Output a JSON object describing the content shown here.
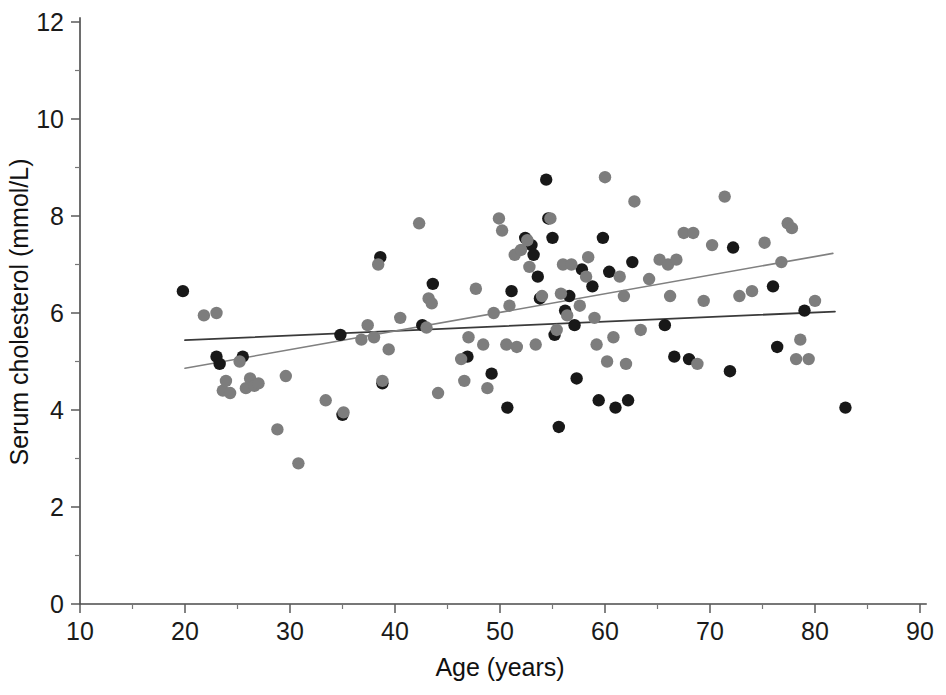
{
  "chart_data": {
    "type": "scatter",
    "title": "",
    "subtitle": "",
    "xlabel": "Age (years)",
    "ylabel": "Serum cholesterol  (mmol/L)",
    "xlim": [
      10,
      90
    ],
    "ylim": [
      0,
      12
    ],
    "xticks": [
      10,
      20,
      30,
      40,
      50,
      60,
      70,
      80,
      90
    ],
    "xtick_labels": [
      "10",
      "20",
      "30",
      "40",
      "50",
      "60",
      "70",
      "80",
      "90"
    ],
    "yticks": [
      0,
      2,
      4,
      6,
      8,
      10,
      12
    ],
    "ytick_labels": [
      "0",
      "2",
      "4",
      "6",
      "8",
      "10",
      "12"
    ],
    "y_minor_ticks": [
      1,
      3,
      5,
      7,
      9,
      11
    ],
    "grid": false,
    "legend": false,
    "legend_position": "none",
    "colors": {
      "dark_marker": "#181818",
      "gray_marker": "#7d7d7d",
      "dark_line": "#3a3a3a",
      "gray_line": "#808080",
      "axis": "#4a4a4a",
      "background": "#ffffff"
    },
    "series": [
      {
        "name": "dark-group",
        "marker": "circle",
        "color": "#181818",
        "points": [
          [
            19.8,
            6.45
          ],
          [
            23.0,
            5.1
          ],
          [
            23.3,
            4.95
          ],
          [
            25.5,
            5.1
          ],
          [
            34.8,
            5.55
          ],
          [
            35.0,
            3.9
          ],
          [
            38.6,
            7.15
          ],
          [
            38.8,
            4.55
          ],
          [
            42.6,
            5.75
          ],
          [
            43.6,
            6.6
          ],
          [
            46.9,
            5.1
          ],
          [
            49.2,
            4.75
          ],
          [
            50.7,
            4.05
          ],
          [
            51.1,
            6.45
          ],
          [
            52.4,
            7.55
          ],
          [
            53.0,
            7.4
          ],
          [
            53.2,
            7.2
          ],
          [
            53.6,
            6.75
          ],
          [
            53.8,
            6.3
          ],
          [
            54.4,
            8.75
          ],
          [
            54.6,
            7.95
          ],
          [
            55.0,
            7.55
          ],
          [
            55.2,
            5.55
          ],
          [
            55.6,
            3.65
          ],
          [
            56.2,
            6.05
          ],
          [
            56.6,
            6.35
          ],
          [
            57.1,
            5.75
          ],
          [
            57.3,
            4.65
          ],
          [
            57.8,
            6.9
          ],
          [
            58.8,
            6.55
          ],
          [
            59.4,
            4.2
          ],
          [
            59.8,
            7.55
          ],
          [
            60.4,
            6.85
          ],
          [
            61.0,
            4.05
          ],
          [
            62.2,
            4.2
          ],
          [
            62.6,
            7.05
          ],
          [
            65.7,
            5.75
          ],
          [
            66.6,
            5.1
          ],
          [
            68.0,
            5.05
          ],
          [
            71.9,
            4.8
          ],
          [
            72.2,
            7.35
          ],
          [
            76.0,
            6.55
          ],
          [
            76.4,
            5.3
          ],
          [
            79.0,
            6.05
          ],
          [
            82.9,
            4.05
          ]
        ]
      },
      {
        "name": "gray-group",
        "marker": "circle",
        "color": "#7d7d7d",
        "points": [
          [
            21.8,
            5.95
          ],
          [
            23.0,
            6.0
          ],
          [
            23.6,
            4.4
          ],
          [
            23.9,
            4.6
          ],
          [
            24.3,
            4.35
          ],
          [
            25.2,
            5.0
          ],
          [
            25.8,
            4.45
          ],
          [
            26.2,
            4.65
          ],
          [
            26.6,
            4.5
          ],
          [
            27.0,
            4.55
          ],
          [
            28.8,
            3.6
          ],
          [
            29.6,
            4.7
          ],
          [
            30.8,
            2.9
          ],
          [
            33.4,
            4.2
          ],
          [
            35.1,
            3.95
          ],
          [
            36.8,
            5.45
          ],
          [
            37.4,
            5.75
          ],
          [
            38.0,
            5.5
          ],
          [
            38.4,
            7.0
          ],
          [
            38.8,
            4.6
          ],
          [
            39.4,
            5.25
          ],
          [
            40.5,
            5.9
          ],
          [
            42.3,
            7.85
          ],
          [
            43.0,
            5.7
          ],
          [
            43.2,
            6.3
          ],
          [
            43.5,
            6.2
          ],
          [
            44.1,
            4.35
          ],
          [
            46.3,
            5.05
          ],
          [
            46.6,
            4.6
          ],
          [
            47.0,
            5.5
          ],
          [
            47.7,
            6.5
          ],
          [
            48.4,
            5.35
          ],
          [
            48.8,
            4.45
          ],
          [
            49.4,
            6.0
          ],
          [
            49.9,
            7.95
          ],
          [
            50.2,
            7.7
          ],
          [
            50.6,
            5.35
          ],
          [
            50.9,
            6.15
          ],
          [
            51.4,
            7.2
          ],
          [
            51.6,
            5.3
          ],
          [
            52.0,
            7.3
          ],
          [
            52.6,
            7.5
          ],
          [
            52.8,
            6.95
          ],
          [
            53.4,
            5.35
          ],
          [
            54.0,
            6.35
          ],
          [
            54.8,
            7.95
          ],
          [
            55.4,
            5.65
          ],
          [
            55.8,
            6.4
          ],
          [
            56.0,
            7.0
          ],
          [
            56.4,
            5.95
          ],
          [
            56.8,
            7.0
          ],
          [
            57.6,
            6.15
          ],
          [
            58.2,
            6.75
          ],
          [
            58.4,
            7.15
          ],
          [
            59.0,
            5.9
          ],
          [
            59.2,
            5.35
          ],
          [
            60.0,
            8.8
          ],
          [
            60.2,
            5.0
          ],
          [
            60.8,
            5.5
          ],
          [
            61.4,
            6.75
          ],
          [
            61.8,
            6.35
          ],
          [
            62.0,
            4.95
          ],
          [
            62.8,
            8.3
          ],
          [
            63.4,
            5.65
          ],
          [
            64.2,
            6.7
          ],
          [
            65.2,
            7.1
          ],
          [
            66.0,
            7.0
          ],
          [
            66.2,
            6.35
          ],
          [
            66.8,
            7.1
          ],
          [
            67.5,
            7.65
          ],
          [
            68.4,
            7.65
          ],
          [
            68.8,
            4.95
          ],
          [
            69.4,
            6.25
          ],
          [
            70.2,
            7.4
          ],
          [
            71.4,
            8.4
          ],
          [
            72.8,
            6.35
          ],
          [
            74.0,
            6.45
          ],
          [
            75.2,
            7.45
          ],
          [
            76.8,
            7.05
          ],
          [
            77.4,
            7.85
          ],
          [
            77.8,
            7.75
          ],
          [
            78.2,
            5.05
          ],
          [
            78.6,
            5.45
          ],
          [
            79.4,
            5.05
          ],
          [
            80.0,
            6.25
          ]
        ]
      }
    ],
    "trendlines": [
      {
        "name": "dark-trendline",
        "color": "#3a3a3a",
        "x_start": 20.0,
        "y_start": 5.44,
        "x_end": 81.9,
        "y_end": 6.03
      },
      {
        "name": "gray-trendline",
        "color": "#808080",
        "x_start": 20.0,
        "y_start": 4.86,
        "x_end": 81.7,
        "y_end": 7.23
      }
    ]
  }
}
